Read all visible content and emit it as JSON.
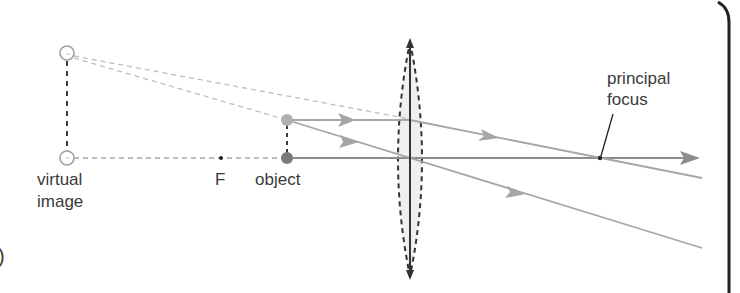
{
  "diagram": {
    "labels": {
      "virtual_image_line1": "virtual",
      "virtual_image_line2": "image",
      "focal_point": "F",
      "object": "object",
      "principal_focus_line1": "principal",
      "principal_focus_line2": "focus",
      "part_marker": ")"
    },
    "colors": {
      "ray": "#a6a6a6",
      "axis": "#8c8c8c",
      "dashed_construction": "#bdbdbd",
      "dark_dash": "#3c3c3c",
      "object_top": "#b0b0b0",
      "object_bottom": "#7a7a7a",
      "lens_fill": "#efefef",
      "lens_outline": "#333333",
      "text": "#3a3a3a",
      "border": "#222222"
    },
    "elements": {
      "virtual_image_top": [
        67,
        53
      ],
      "virtual_image_bottom": [
        67,
        158
      ],
      "object_top": [
        287,
        120
      ],
      "object_bottom": [
        287,
        158
      ],
      "focal_point_F": [
        221,
        158
      ],
      "lens_center_x": 410,
      "principal_focus": [
        600,
        158
      ]
    }
  }
}
